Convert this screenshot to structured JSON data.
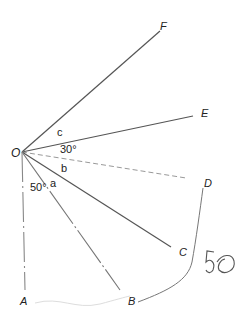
{
  "diagram": {
    "type": "geometry-angles",
    "origin": {
      "name": "O",
      "x": 22,
      "y": 152
    },
    "points": [
      {
        "name": "F",
        "x": 162,
        "y": 28
      },
      {
        "name": "E",
        "x": 195,
        "y": 116
      },
      {
        "name": "D",
        "x": 207,
        "y": 184
      },
      {
        "name": "C",
        "x": 170,
        "y": 245
      },
      {
        "name": "B",
        "x": 133,
        "y": 300
      },
      {
        "name": "A",
        "x": 22,
        "y": 300
      }
    ],
    "labels": {
      "O": "O",
      "F": "F",
      "E": "E",
      "D": "D",
      "C": "C",
      "B": "B",
      "A": "A"
    },
    "angle_labels": {
      "c": "c",
      "thirty": "30°",
      "b": "b",
      "a": "a",
      "fifty": "50°"
    },
    "handwritten_note": "50",
    "colors": {
      "line": "#555555",
      "dashed": "#bbbbbb",
      "text": "#222222"
    }
  }
}
